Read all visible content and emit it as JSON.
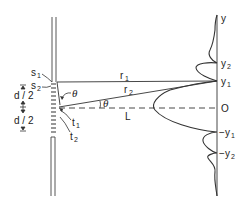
{
  "diagram": {
    "type": "double-slit-interference",
    "colors": {
      "stroke": "#333333",
      "background": "#ffffff"
    },
    "labels": {
      "s1": "s",
      "s1_sub": "1",
      "s2": "s",
      "s2_sub": "2",
      "t1": "t",
      "t1_sub": "1",
      "t2": "t",
      "t2_sub": "2",
      "d_half_top": "d / 2",
      "d_half_bottom": "d / 2",
      "theta_slit": "θ",
      "theta_center": "θ",
      "r1": "r",
      "r1_sub": "1",
      "r2": "r",
      "r2_sub": "2",
      "L": "L"
    },
    "screen_axis": {
      "y_label": "y",
      "ticks": [
        {
          "label": "y",
          "sub": "2",
          "prefix": ""
        },
        {
          "label": "y",
          "sub": "1",
          "prefix": ""
        },
        {
          "label": "O",
          "sub": "",
          "prefix": ""
        },
        {
          "label": "y",
          "sub": "1",
          "prefix": "−"
        },
        {
          "label": "y",
          "sub": "2",
          "prefix": "−"
        }
      ]
    }
  }
}
